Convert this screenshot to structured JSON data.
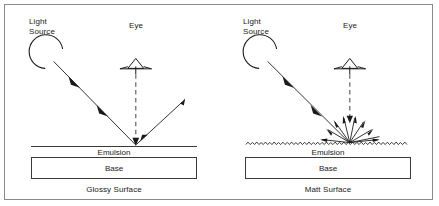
{
  "figure": {
    "border_color": "#8a8a8a",
    "background": "#ffffff",
    "ink_color": "#1a1a1a"
  },
  "panels": [
    {
      "id": "glossy",
      "caption": "Glossy Surface",
      "light_source_label": "Light\nSource",
      "eye_label": "Eye",
      "emulsion_label": "Emulsion",
      "base_label": "Base",
      "surface_type": "specular",
      "surface_texture": "smooth",
      "incident_ray": "single arrow from light source down-right to surface",
      "reflected_ray": "single arrow up-right from surface",
      "eye_ray": "dashed vertical arrow from eye down to surface"
    },
    {
      "id": "matt",
      "caption": "Matt Surface",
      "light_source_label": "Light\nSource",
      "eye_label": "Eye",
      "emulsion_label": "Emulsion",
      "base_label": "Base",
      "surface_type": "diffuse",
      "surface_texture": "rough",
      "incident_ray": "single arrow from light source down-right to surface",
      "reflected_ray": "nine scattered arrows radiating from surface",
      "eye_ray": "dashed vertical arrow from eye down to surface",
      "scatter_ray_count": 9
    }
  ],
  "icons": {
    "light_source": "lamp-arc-icon",
    "eye": "eye-triangle-icon"
  }
}
